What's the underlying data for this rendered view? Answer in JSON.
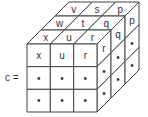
{
  "label": "c =",
  "cube": {
    "size": 3,
    "front_face": [
      [
        "x",
        "u",
        "r"
      ],
      [
        "•",
        "•",
        "•"
      ],
      [
        "•",
        "•",
        "•"
      ]
    ],
    "top_face": [
      [
        "v",
        "s",
        "p"
      ],
      [
        "w",
        "t",
        "q"
      ],
      [
        "x",
        "u",
        "r"
      ]
    ],
    "right_face": [
      [
        "r",
        "q",
        "p"
      ],
      [
        "•",
        "•",
        "•"
      ],
      [
        "•",
        "•",
        "•"
      ]
    ]
  },
  "colors": {
    "line": "#444444",
    "text": "#333333",
    "background": "#ffffff"
  }
}
